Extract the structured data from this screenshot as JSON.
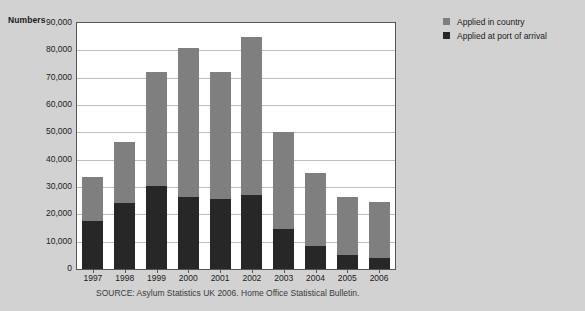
{
  "chart_data": {
    "type": "bar",
    "subtype": "stacked-vertical",
    "title": "",
    "xlabel": "",
    "ylabel": "Numbers",
    "ylim": [
      0,
      90000
    ],
    "grid": true,
    "legend_position": "right",
    "categories": [
      "1997",
      "1998",
      "1999",
      "2000",
      "2001",
      "2002",
      "2003",
      "2004",
      "2005",
      "2006"
    ],
    "ytick_labels": [
      "90,000",
      "80,000",
      "70,000",
      "60,000",
      "50,000",
      "40,000",
      "30,000",
      "20,000",
      "10,000",
      "0"
    ],
    "ytick_values": [
      90000,
      80000,
      70000,
      60000,
      50000,
      40000,
      30000,
      20000,
      10000,
      0
    ],
    "series": [
      {
        "name": "Applied at port of arrival",
        "color": "#272727",
        "values": [
          17500,
          24000,
          30500,
          26500,
          25500,
          27000,
          14500,
          8500,
          5000,
          4000
        ]
      },
      {
        "name": "Applied in country",
        "color": "#7f7f7f",
        "values": [
          16000,
          22500,
          41500,
          54500,
          46500,
          58000,
          35500,
          26500,
          21500,
          20500
        ]
      }
    ],
    "totals": [
      33500,
      46500,
      72000,
      81000,
      72000,
      85000,
      50000,
      35000,
      26500,
      24500
    ]
  },
  "axis": {
    "y_title": "Numbers"
  },
  "legend": {
    "items": [
      {
        "label": "Applied in country",
        "color": "#7f7f7f",
        "swatch_icon": "square-swatch-icon"
      },
      {
        "label": "Applied at port of arrival",
        "color": "#272727",
        "swatch_icon": "square-swatch-icon"
      }
    ]
  },
  "source": {
    "text": "SOURCE: Asylum Statistics UK 2006. Home Office Statistical Bulletin."
  },
  "colors": {
    "background": "#d2d2d2",
    "plot_background": "#ffffff",
    "plot_border": "#555555",
    "gridline": "#bdbdbd",
    "text": "#1b1b1b",
    "series_in_country": "#7f7f7f",
    "series_port_of_arrival": "#272727"
  }
}
